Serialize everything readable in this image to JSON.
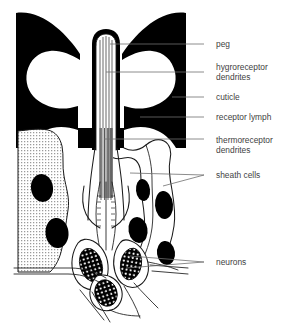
{
  "figure": {
    "background_color": "#ffffff",
    "ink_color": "#000000",
    "label_color": "#3f3f3f",
    "leader_color": "#6e6e6e"
  },
  "labels": [
    {
      "id": "peg",
      "text": "peg",
      "lines": [
        "peg"
      ],
      "text_x": 216,
      "text_y": 47,
      "leader": "M 204 44 L 110 44"
    },
    {
      "id": "hygroreceptor-dendrites",
      "text": "hygroreceptor dendrites",
      "lines": [
        "hygroreceptor",
        "dendrites"
      ],
      "text_x": 216,
      "text_y": 70,
      "leader": "M 204 72 L 106 72"
    },
    {
      "id": "cuticle",
      "text": "cuticle",
      "lines": [
        "cuticle"
      ],
      "text_x": 216,
      "text_y": 100,
      "leader": "M 204 97 L 172 97"
    },
    {
      "id": "receptor-lymph",
      "text": "receptor lymph",
      "lines": [
        "receptor lymph"
      ],
      "text_x": 216,
      "text_y": 120,
      "leader": "M 204 117 L 140 117"
    },
    {
      "id": "thermoreceptor-dendrites",
      "text": "thermoreceptor dendrites",
      "lines": [
        "thermoreceptor",
        "dendrites"
      ],
      "text_x": 216,
      "text_y": 143,
      "leader": "M 204 139 L 104 139"
    },
    {
      "id": "sheath-cells",
      "text": "sheath cells",
      "lines": [
        "sheath cells"
      ],
      "text_x": 216,
      "text_y": 178,
      "leader": "M 204 175 L 130 173 M 204 175 L 163 186"
    },
    {
      "id": "neurons",
      "text": "neurons",
      "lines": [
        "neurons"
      ],
      "text_x": 216,
      "text_y": 265,
      "leader": "M 204 262 L 130 256 M 204 262 L 126 268"
    }
  ],
  "structures": {
    "cuticle": {
      "name": "cuticle",
      "fill": "#000000",
      "description": "black horn-shaped cuticle wall flanking the peg"
    },
    "peg": {
      "name": "peg",
      "description": "central rounded-tip tubular peg with internal dendrites"
    },
    "sheath_cells_left": {
      "name": "sheath-cell-left",
      "texture": "stipple-grid",
      "nuclei": 2
    },
    "sheath_cells_right": {
      "name": "sheath-cell-right",
      "texture": "plain",
      "nuclei": 4
    },
    "neurons": {
      "name": "neuron-cell-bodies",
      "count": 3,
      "nucleus_texture": "speckled"
    }
  }
}
